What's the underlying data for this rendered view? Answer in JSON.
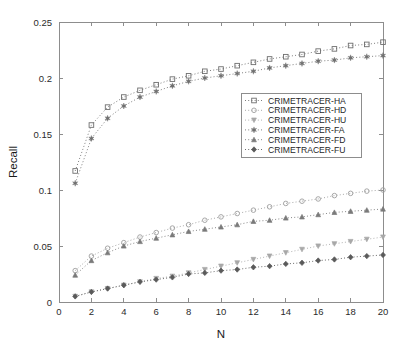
{
  "chart_data": {
    "type": "line",
    "title": "",
    "xlabel": "N",
    "ylabel": "Recall",
    "xlim": [
      0,
      20
    ],
    "ylim": [
      0,
      0.25
    ],
    "xticks": [
      "0",
      "2",
      "4",
      "6",
      "8",
      "10",
      "12",
      "14",
      "16",
      "18",
      "20"
    ],
    "xtick_values": [
      0,
      2,
      4,
      6,
      8,
      10,
      12,
      14,
      16,
      18,
      20
    ],
    "yticks": [
      "0",
      "0.05",
      "0.1",
      "0.15",
      "0.2",
      "0.25"
    ],
    "ytick_values": [
      0,
      0.05,
      0.1,
      0.15,
      0.2,
      0.25
    ],
    "grid": false,
    "legend_position": "center-right",
    "x": [
      1,
      2,
      3,
      4,
      5,
      6,
      7,
      8,
      9,
      10,
      11,
      12,
      13,
      14,
      15,
      16,
      17,
      18,
      19,
      20
    ],
    "series": [
      {
        "name": "CRIMETRACER-HA",
        "marker": "square",
        "color": "#6e6e6e",
        "values": [
          0.117,
          0.158,
          0.174,
          0.183,
          0.189,
          0.194,
          0.199,
          0.202,
          0.206,
          0.208,
          0.211,
          0.214,
          0.217,
          0.219,
          0.221,
          0.224,
          0.226,
          0.229,
          0.23,
          0.232
        ]
      },
      {
        "name": "CRIMETRACER-HD",
        "marker": "circle",
        "color": "#9e9e9e",
        "values": [
          0.028,
          0.041,
          0.048,
          0.053,
          0.058,
          0.062,
          0.066,
          0.069,
          0.073,
          0.076,
          0.079,
          0.082,
          0.085,
          0.088,
          0.09,
          0.092,
          0.095,
          0.097,
          0.099,
          0.1
        ]
      },
      {
        "name": "CRIMETRACER-HU",
        "marker": "triangle-down",
        "color": "#a8a8a8",
        "values": [
          0.005,
          0.009,
          0.012,
          0.015,
          0.018,
          0.021,
          0.023,
          0.026,
          0.029,
          0.032,
          0.035,
          0.038,
          0.041,
          0.044,
          0.047,
          0.05,
          0.052,
          0.054,
          0.056,
          0.058
        ]
      },
      {
        "name": "CRIMETRACER-FA",
        "marker": "star",
        "color": "#707070",
        "values": [
          0.106,
          0.146,
          0.164,
          0.175,
          0.183,
          0.188,
          0.193,
          0.197,
          0.2,
          0.202,
          0.204,
          0.206,
          0.209,
          0.211,
          0.213,
          0.215,
          0.216,
          0.218,
          0.219,
          0.22
        ]
      },
      {
        "name": "CRIMETRACER-FD",
        "marker": "triangle-up",
        "color": "#7a7a7a",
        "values": [
          0.024,
          0.037,
          0.044,
          0.05,
          0.054,
          0.057,
          0.06,
          0.063,
          0.065,
          0.067,
          0.069,
          0.072,
          0.073,
          0.075,
          0.076,
          0.078,
          0.08,
          0.081,
          0.082,
          0.083
        ]
      },
      {
        "name": "CRIMETRACER-FU",
        "marker": "diamond",
        "color": "#5a5a5a",
        "values": [
          0.005,
          0.009,
          0.012,
          0.015,
          0.018,
          0.02,
          0.022,
          0.025,
          0.026,
          0.028,
          0.029,
          0.031,
          0.032,
          0.034,
          0.035,
          0.037,
          0.038,
          0.04,
          0.041,
          0.042
        ]
      }
    ]
  }
}
